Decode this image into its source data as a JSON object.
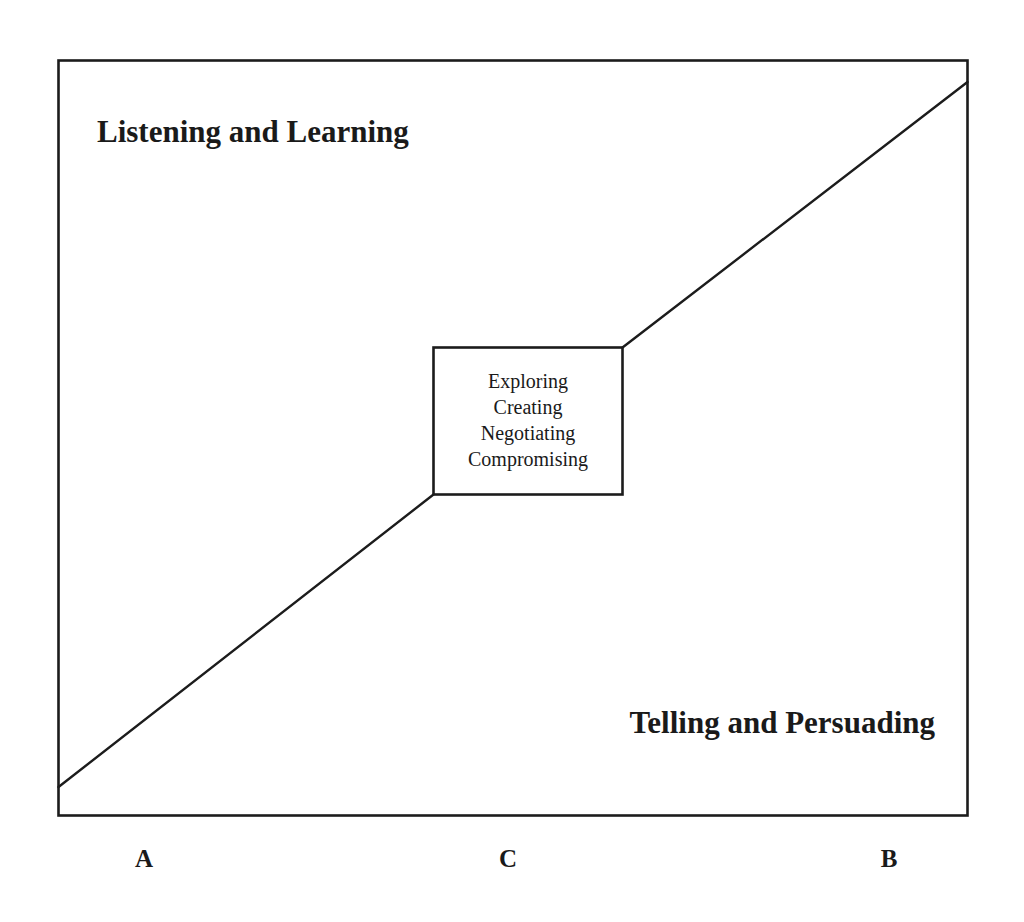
{
  "diagram": {
    "type": "continuum-diagram",
    "colors": {
      "stroke": "#1c1c1c",
      "text": "#1a1a1a",
      "background": "#ffffff"
    },
    "regions": {
      "upper_left": "Listening and Learning",
      "lower_right": "Telling and Persuading"
    },
    "center_box": {
      "lines": [
        "Exploring",
        "Creating",
        "Negotiating",
        "Compromising"
      ]
    },
    "axis_points": {
      "left": "A",
      "center": "C",
      "right": "B"
    }
  }
}
